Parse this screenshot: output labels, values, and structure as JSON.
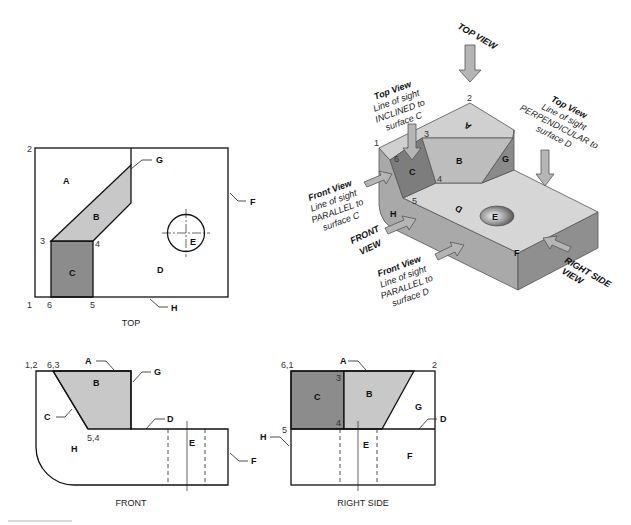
{
  "views": {
    "top": {
      "caption": "TOP",
      "surfaces": {
        "A": "A",
        "B": "B",
        "C": "C",
        "D": "D",
        "E": "E"
      },
      "leaders": {
        "G": "G",
        "F": "F",
        "H": "H"
      },
      "points": {
        "p1": "1",
        "p2": "2",
        "p3": "3",
        "p4": "4",
        "p5": "5",
        "p6": "6"
      }
    },
    "front": {
      "caption": "FRONT",
      "surfaces": {
        "B": "B",
        "H": "H",
        "E": "E"
      },
      "leaders": {
        "A": "A",
        "G": "G",
        "C": "C",
        "D": "D",
        "F": "F"
      },
      "points": {
        "p12": "1,2",
        "p63": "6,3",
        "p54": "5,4"
      }
    },
    "right_side": {
      "caption": "RIGHT SIDE",
      "surfaces": {
        "C": "C",
        "B": "B",
        "G": "G",
        "E": "E",
        "F": "F"
      },
      "leaders": {
        "A": "A",
        "D": "D",
        "H": "H"
      },
      "points": {
        "p61": "6,1",
        "p2": "2",
        "p3": "3",
        "p4": "4",
        "p5": "5"
      }
    },
    "pictorial": {
      "surfaces": {
        "A": "A",
        "B": "B",
        "C": "C",
        "D": "D",
        "E": "E",
        "F": "F",
        "G": "G",
        "H": "H"
      },
      "points": {
        "p1": "1",
        "p2": "2",
        "p3": "3",
        "p4": "4",
        "p5": "5",
        "p6": "6"
      },
      "arrows": {
        "top_view": "TOP VIEW",
        "front_view_1": "FRONT",
        "front_view_2": "VIEW",
        "right_side_1": "RIGHT SIDE",
        "right_side_2": "VIEW"
      },
      "notes": {
        "inclined": {
          "title": "Top View",
          "l1": "Line of sight",
          "l2": "INCLINED to",
          "l3": "surface C"
        },
        "perpendicular": {
          "title": "Top View",
          "l1": "Line of sight",
          "l2": "PERPENDICULAR to",
          "l3": "surface D"
        },
        "parallel_c": {
          "title": "Front View",
          "l1": "Line of sight",
          "l2": "PARALLEL to",
          "l3": "surface C"
        },
        "parallel_d": {
          "title": "Front View",
          "l1": "Line of sight",
          "l2": "PARALLEL to",
          "l3": "surface D"
        }
      }
    }
  },
  "colors": {
    "surface_b": "#c8c8c8",
    "surface_c": "#8c8c8c",
    "iso_top": "#d6d6d6",
    "iso_left": "#a9a9a9",
    "iso_right": "#8f8f8f",
    "line": "#111111"
  }
}
